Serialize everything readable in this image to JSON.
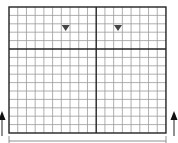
{
  "diagram": {
    "type": "grid-with-markers",
    "grid": {
      "columns": 18,
      "rows": 15,
      "major_column_split": 10,
      "major_row_split": 5,
      "x": 9,
      "y": 7,
      "cell_w": 8.72,
      "cell_h": 8.4,
      "minor_line_color": "#9a9a9a",
      "major_line_color": "#222222"
    },
    "markers": [
      {
        "name": "triangle-marker-1",
        "shape": "down-triangle",
        "col": 6,
        "row": 2,
        "color": "#444444"
      },
      {
        "name": "triangle-marker-2",
        "shape": "down-triangle",
        "col": 12,
        "row": 2,
        "color": "#444444"
      }
    ],
    "arrows": [
      {
        "name": "left-up-arrow",
        "direction": "up",
        "x": 2
      },
      {
        "name": "right-up-arrow",
        "direction": "up",
        "x": 174
      }
    ],
    "bracket": {
      "name": "bottom-span-bracket",
      "from_x": 9,
      "to_x": 166,
      "y": 141
    }
  }
}
